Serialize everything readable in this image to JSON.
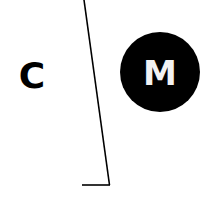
{
  "diagram": {
    "left_label": "C",
    "circle_label": "M",
    "colors": {
      "ink": "#000000",
      "background": "#ffffff",
      "circle_text": "#ffffff"
    }
  }
}
